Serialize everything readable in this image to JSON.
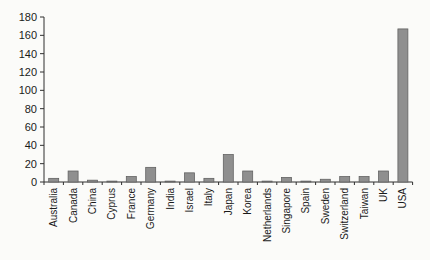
{
  "figure": {
    "background": "#fbfbf9"
  },
  "chart_data": {
    "type": "bar",
    "title": "",
    "xlabel": "",
    "ylabel": "",
    "categories": [
      "Australia",
      "Canada",
      "China",
      "Cyprus",
      "France",
      "Germany",
      "India",
      "Israel",
      "Italy",
      "Japan",
      "Korea",
      "Netherlands",
      "Singapore",
      "Spain",
      "Sweden",
      "Switzerland",
      "Taiwan",
      "UK",
      "USA"
    ],
    "values": [
      4,
      12,
      2,
      1,
      6,
      16,
      1,
      10,
      4,
      30,
      12,
      1,
      5,
      1,
      3,
      6,
      6,
      12,
      167
    ],
    "ylim": [
      0,
      180
    ],
    "ytick_step": 20,
    "ytick_labels": [
      "0",
      "20",
      "40",
      "60",
      "80",
      "100",
      "120",
      "140",
      "160",
      "180"
    ],
    "grid": false,
    "legend": null,
    "x_labels_rotated_degrees": -90,
    "bar_color": "#8f8f8f",
    "bar_border_color": "#5e5e5e",
    "axis_color": "#2f2f2f",
    "tick_label_color": "#1a1a1a"
  }
}
